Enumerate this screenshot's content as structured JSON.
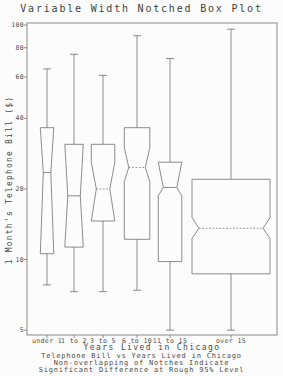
{
  "title": "Variable Width Notched Box Plot",
  "caption": {
    "lines": [
      "Telephone Bill vs Years Lived in Chicago",
      "Non-overlapping of Notches Indicate",
      "Significant Difference at Rough 95% Level"
    ]
  },
  "colors": {
    "line": "#6e6e6e",
    "text": "#4a4a4a",
    "background": "#fcfcfc"
  },
  "chart_data": {
    "type": "boxplot",
    "title": "Variable Width Notched Box Plot",
    "xlabel": "Years Lived in Chicago",
    "ylabel": "1 Month's Telephone Bill ($)",
    "y_scale": "log",
    "ylim": [
      4.8,
      102
    ],
    "yticks": [
      100,
      80,
      60,
      40,
      20,
      10,
      5
    ],
    "grid": false,
    "legend": "none",
    "box_width_note": "box width varies with group size",
    "categories": [
      "under 1",
      "1 to 2",
      "3 to 5",
      "6 to 10",
      "11 to 15",
      "over 15"
    ],
    "boxes": [
      {
        "label": "under 1",
        "center_px": 47,
        "width_px": 13.5,
        "whisker_low": 7.8,
        "q1": 10.6,
        "median": 23.5,
        "q3": 36.5,
        "whisker_high": 65,
        "notch_low": 10.6,
        "notch_high": 36.5,
        "notch_depth_px": 3,
        "median_style": "solid"
      },
      {
        "label": "1 to 2",
        "center_px": 74,
        "width_px": 18.5,
        "whisker_low": 7.3,
        "q1": 11.3,
        "median": 18.7,
        "q3": 31,
        "whisker_high": 75,
        "notch_low": 11.3,
        "notch_high": 31,
        "notch_depth_px": 3,
        "median_style": "solid"
      },
      {
        "label": "3 to 5",
        "center_px": 103,
        "width_px": 23.5,
        "whisker_low": 7.3,
        "q1": 14.6,
        "median": 20,
        "q3": 31,
        "whisker_high": 61,
        "notch_low": 14.6,
        "notch_high": 26,
        "notch_depth_px": 5,
        "median_style": "dotted"
      },
      {
        "label": "6 to 10",
        "center_px": 137,
        "width_px": 25.5,
        "whisker_low": 7.4,
        "q1": 12.2,
        "median": 24.7,
        "q3": 36.5,
        "whisker_high": 90,
        "notch_low": 21.5,
        "notch_high": 30,
        "notch_depth_px": 4.5,
        "median_style": "dotted"
      },
      {
        "label": "11 to 15",
        "center_px": 170,
        "width_px": 23.5,
        "whisker_low": 5.0,
        "q1": 9.8,
        "median": 20.3,
        "q3": 26,
        "whisker_high": 72,
        "notch_low": 18.7,
        "notch_high": 26,
        "notch_depth_px": 5,
        "median_style": "solid"
      },
      {
        "label": "over 15",
        "center_px": 231,
        "width_px": 78,
        "whisker_low": 5.0,
        "q1": 8.7,
        "median": 13.6,
        "q3": 22,
        "whisker_high": 96,
        "notch_low": 12.3,
        "notch_high": 15.1,
        "notch_depth_px": 7,
        "median_style": "dotted"
      }
    ]
  }
}
